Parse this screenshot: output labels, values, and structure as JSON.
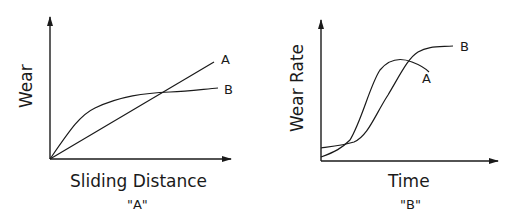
{
  "diagrams": [
    {
      "id": "A",
      "caption": "\"A\"",
      "xlabel": "Sliding Distance",
      "ylabel": "Wear",
      "curves": [
        {
          "label": "A",
          "description": "linear wear vs sliding distance"
        },
        {
          "label": "B",
          "description": "initial rapid wear then plateau"
        }
      ]
    },
    {
      "id": "B",
      "caption": "\"B\"",
      "xlabel": "Time",
      "ylabel": "Wear Rate",
      "curves": [
        {
          "label": "A",
          "description": "rises steeply, peaks, then declines"
        },
        {
          "label": "B",
          "description": "sigmoidal rise to plateau"
        }
      ]
    }
  ],
  "colors": {
    "line": "#1a1a1a",
    "background": "#ffffff"
  }
}
